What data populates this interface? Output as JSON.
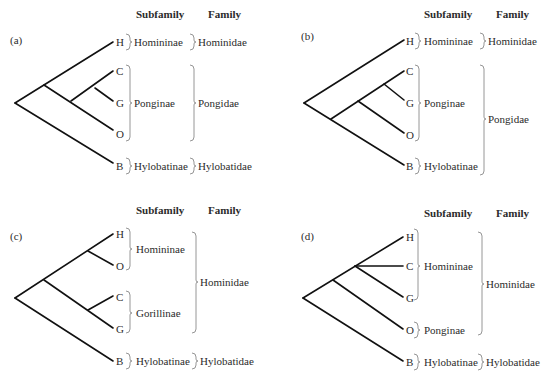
{
  "figure": {
    "column_headers": {
      "subfamily": "Subfamily",
      "family": "Family"
    },
    "panels": [
      {
        "id": "a",
        "label": "(a)",
        "tips": [
          "H",
          "C",
          "G",
          "O",
          "B"
        ],
        "topology": "((H,((C,G),O)),B)",
        "subfamilies": [
          {
            "name": "Homininae",
            "members": [
              "H"
            ]
          },
          {
            "name": "Ponginae",
            "members": [
              "C",
              "G",
              "O"
            ]
          },
          {
            "name": "Hylobatinae",
            "members": [
              "B"
            ]
          }
        ],
        "families": [
          {
            "name": "Hominidae",
            "members": [
              "H"
            ]
          },
          {
            "name": "Pongidae",
            "members": [
              "C",
              "G",
              "O"
            ]
          },
          {
            "name": "Hylobatidae",
            "members": [
              "B"
            ]
          }
        ]
      },
      {
        "id": "b",
        "label": "(b)",
        "tips": [
          "H",
          "C",
          "G",
          "O",
          "B"
        ],
        "topology": "(H,(((C,G),O),B))",
        "subfamilies": [
          {
            "name": "Homininae",
            "members": [
              "H"
            ]
          },
          {
            "name": "Ponginae",
            "members": [
              "C",
              "G",
              "O"
            ]
          },
          {
            "name": "Hylobatinae",
            "members": [
              "B"
            ]
          }
        ],
        "families": [
          {
            "name": "Hominidae",
            "members": [
              "H"
            ]
          },
          {
            "name": "Pongidae",
            "members": [
              "C",
              "G",
              "O",
              "B"
            ]
          }
        ]
      },
      {
        "id": "c",
        "label": "(c)",
        "tips": [
          "H",
          "O",
          "C",
          "G",
          "B"
        ],
        "topology": "(((H,O),(C,G)),B)",
        "subfamilies": [
          {
            "name": "Homininae",
            "members": [
              "H",
              "O"
            ]
          },
          {
            "name": "Gorillinae",
            "members": [
              "C",
              "G"
            ]
          },
          {
            "name": "Hylobatinae",
            "members": [
              "B"
            ]
          }
        ],
        "families": [
          {
            "name": "Hominidae",
            "members": [
              "H",
              "O",
              "C",
              "G"
            ]
          },
          {
            "name": "Hylobatidae",
            "members": [
              "B"
            ]
          }
        ]
      },
      {
        "id": "d",
        "label": "(d)",
        "tips": [
          "H",
          "C",
          "G",
          "O",
          "B"
        ],
        "topology": "(((H,C,G),O),B)",
        "subfamilies": [
          {
            "name": "Homininae",
            "members": [
              "H",
              "C",
              "G"
            ]
          },
          {
            "name": "Ponginae",
            "members": [
              "O"
            ]
          },
          {
            "name": "Hylobatinae",
            "members": [
              "B"
            ]
          }
        ],
        "families": [
          {
            "name": "Hominidae",
            "members": [
              "H",
              "C",
              "G",
              "O"
            ]
          },
          {
            "name": "Hylobatidae",
            "members": [
              "B"
            ]
          }
        ]
      }
    ]
  }
}
